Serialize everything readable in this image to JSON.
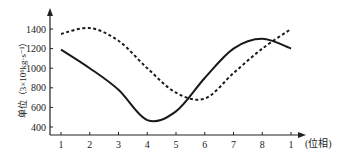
{
  "chart_data": {
    "type": "line",
    "title": "",
    "xlabel": "(位相)",
    "ylabel": "单位（3×10⁶kg·s⁻¹）",
    "x_tick_labels": [
      "1",
      "2",
      "3",
      "4",
      "5",
      "6",
      "7",
      "8",
      "1"
    ],
    "y_ticks": [
      400,
      600,
      800,
      1000,
      1200,
      1400
    ],
    "ylim": [
      330,
      1560
    ],
    "grid": false,
    "legend": null,
    "x": [
      1,
      2,
      3,
      4,
      5,
      6,
      7,
      8,
      9
    ],
    "series": [
      {
        "name": "solid",
        "style": "solid",
        "values": [
          1190,
          1000,
          780,
          470,
          560,
          900,
          1200,
          1300,
          1200
        ]
      },
      {
        "name": "dashed",
        "style": "dashed",
        "values": [
          1350,
          1410,
          1280,
          1000,
          750,
          690,
          950,
          1200,
          1400
        ]
      }
    ]
  }
}
